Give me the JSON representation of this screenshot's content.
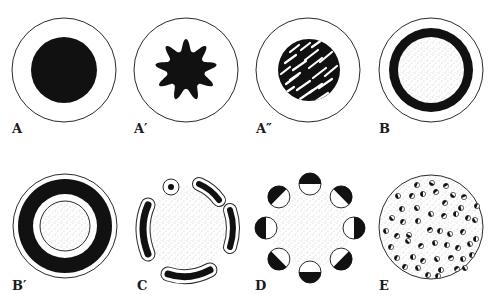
{
  "figure": {
    "colors": {
      "ink": "#111111",
      "paper": "#ffffff",
      "stipple": "#8a8a8a",
      "outline": "#2a2a2a"
    },
    "panels": [
      {
        "id": "A",
        "label": "A",
        "description": "outer circle with solid black inner disc"
      },
      {
        "id": "A1",
        "label": "A′",
        "description": "outer circle with black nine-pointed star shape"
      },
      {
        "id": "A2",
        "label": "A″",
        "description": "outer circle with black disc striped by white diagonal slashes"
      },
      {
        "id": "B",
        "label": "B",
        "description": "outer circle with thick black ring around stippled interior"
      },
      {
        "id": "B1",
        "label": "B′",
        "description": "outer circle with thick black ring, white gap, thin ring, stippled core"
      },
      {
        "id": "C",
        "label": "C",
        "description": "stippled area surrounded by outlined black arc segments and a small dot"
      },
      {
        "id": "D",
        "label": "D",
        "description": "stippled center ringed by eight half-black small circles"
      },
      {
        "id": "E",
        "label": "E",
        "description": "stippled circle filled with many small half-black dots"
      }
    ]
  }
}
